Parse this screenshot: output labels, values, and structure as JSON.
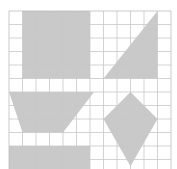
{
  "diagram": {
    "grid": {
      "cols": 12,
      "rows": 12,
      "origin_x": 9,
      "origin_y": 11,
      "cell": 13.5,
      "line_color": "#c8c8c8",
      "border_color": "#bdbdbd"
    },
    "fill_color": "#c9c9c9",
    "shapes": [
      {
        "name": "top-rectangle",
        "points": [
          [
            1,
            0
          ],
          [
            6,
            0
          ],
          [
            6,
            5
          ],
          [
            1,
            5
          ]
        ]
      },
      {
        "name": "upper-right-triangle",
        "points": [
          [
            11,
            0
          ],
          [
            11,
            5
          ],
          [
            7,
            5
          ]
        ]
      },
      {
        "name": "left-trapezoid",
        "points": [
          [
            0,
            6
          ],
          [
            6.3,
            6
          ],
          [
            4,
            9
          ],
          [
            1,
            9
          ]
        ]
      },
      {
        "name": "kite",
        "points": [
          [
            9,
            6
          ],
          [
            11,
            8
          ],
          [
            9,
            11.5
          ],
          [
            7,
            8
          ]
        ]
      },
      {
        "name": "bottom-rectangle",
        "points": [
          [
            0,
            10
          ],
          [
            6,
            10
          ],
          [
            6,
            12
          ],
          [
            0,
            12
          ]
        ]
      }
    ]
  }
}
